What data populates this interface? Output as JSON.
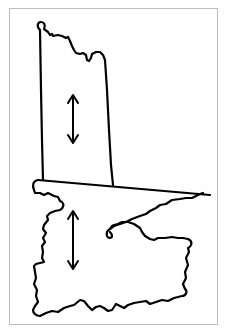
{
  "figure": {
    "type": "line-drawing",
    "colors": {
      "stroke": "#000000",
      "background": "#ffffff",
      "frame": "#bdbdbd"
    },
    "upper_shape": {
      "label": "",
      "arrow": "vertical-double-arrow"
    },
    "lower_shape": {
      "label": "",
      "arrow": "vertical-double-arrow"
    }
  }
}
